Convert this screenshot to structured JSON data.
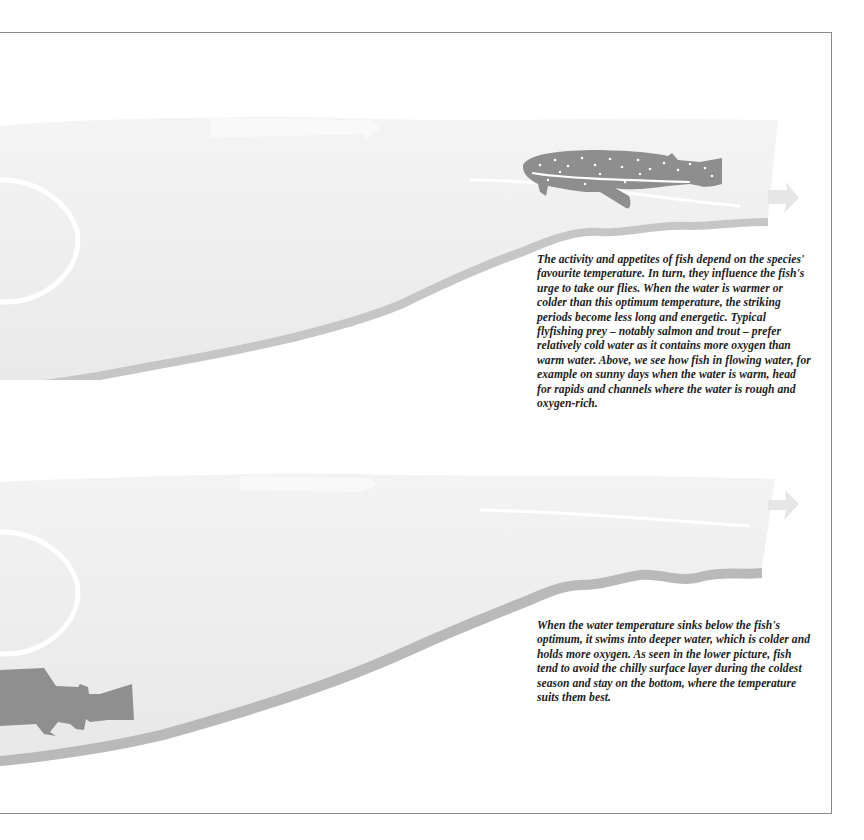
{
  "page": {
    "frame": {
      "line_color": "#8a8a8a"
    },
    "colors": {
      "water": "#ececec",
      "water_light": "#f5f5f5",
      "river_bed": "#c4c4c4",
      "river_bed_dark": "#a8a8a8",
      "fish_dark": "#8c8c8c",
      "fish_light": "#9a9a9a",
      "current_highlight": "#ffffff"
    }
  },
  "illustrations": [
    {
      "id": "top",
      "description": "Warm water: fish in upper flowing water near the surface",
      "fish": {
        "type": "spotted trout",
        "position": "upper-right near surface"
      },
      "elements": [
        "sun-circle",
        "current-arrow",
        "current-arrow-exit",
        "river-bed"
      ]
    },
    {
      "id": "bottom",
      "description": "Cold water: fish near the bottom in deeper water",
      "fish": {
        "type": "trout silhouette",
        "position": "lower-left near bottom"
      },
      "elements": [
        "sun-circle",
        "current-arrow",
        "current-arrow-exit",
        "river-bed"
      ]
    }
  ],
  "captions": {
    "top": "The activity and appetites of fish depend on the species' favourite temperature. In turn, they influence the fish's urge to take our flies. When the water is warmer or colder than this optimum temperature, the striking periods become less long and energetic. Typical flyfishing prey – notably salmon and trout – prefer relatively cold water as it contains more oxygen than warm water. Above, we see how fish in flowing water, for example on sunny days when the water is warm, head for rapids and channels where the water is rough and oxygen-rich.",
    "bottom": "When the water temperature sinks below the fish's optimum, it swims into deeper water, which is colder and holds more oxygen. As seen in the lower picture, fish tend to avoid the chilly surface layer during the coldest season and stay on the bottom, where the temperature suits them best."
  }
}
